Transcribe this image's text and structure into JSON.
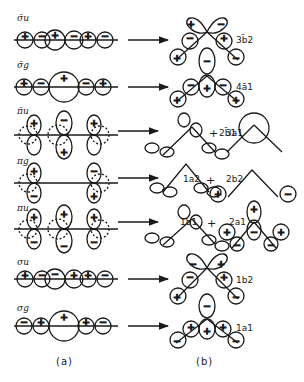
{
  "figure": {
    "panel_a_caption": "(a)",
    "panel_b_caption": "(b)",
    "rows": [
      {
        "label": "σ̄u",
        "result": "3b̄2",
        "extra": null,
        "ligand_signs": [
          "+",
          "−",
          "+",
          "−",
          "+",
          "−"
        ]
      },
      {
        "label": "σ̄g",
        "result": "4ā1",
        "extra": null,
        "ligand_signs": [
          "+",
          "−",
          "+",
          "−",
          "+"
        ]
      },
      {
        "label": "π̄u",
        "result": "2b̄1",
        "extra": "3a1",
        "ligand_signs": [
          "+",
          "−",
          "+"
        ]
      },
      {
        "label": "πg",
        "result": "1a2",
        "extra": "2b2",
        "ligand_signs": [
          "+",
          "−"
        ]
      },
      {
        "label": "πu",
        "result": "1b1",
        "extra": "2a1",
        "ligand_signs": [
          "+",
          "+",
          "+"
        ]
      },
      {
        "label": "σu",
        "result": "1b2",
        "extra": null,
        "ligand_signs": [
          "+",
          "−",
          "−",
          "+",
          "+",
          "−"
        ]
      },
      {
        "label": "σg",
        "result": "1a1",
        "extra": null,
        "ligand_signs": [
          "−",
          "+",
          "+",
          "+",
          "−"
        ]
      }
    ],
    "plus_symbol": "+"
  }
}
